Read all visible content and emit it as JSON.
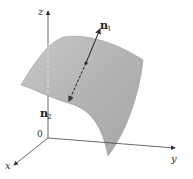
{
  "diagram": {
    "axes": {
      "z_label": "z",
      "y_label": "y",
      "x_label": "x",
      "origin_label": "0"
    },
    "normals": {
      "n1": {
        "base": "n",
        "subscript": "1"
      },
      "n2": {
        "base": "n",
        "subscript": "2"
      }
    },
    "colors": {
      "surface": "#b5b5b5",
      "surface_edge": "#8a8a8a",
      "axes": "#444444",
      "vector": "#222222"
    }
  }
}
